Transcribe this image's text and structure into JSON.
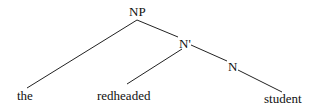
{
  "tree": {
    "nodes": {
      "np": "NP",
      "nbar": "N'",
      "n": "N"
    },
    "leaves": {
      "det": "the",
      "adj": "redheaded",
      "noun": "student"
    }
  },
  "colors": {
    "line": "#222222",
    "text": "#111111"
  }
}
